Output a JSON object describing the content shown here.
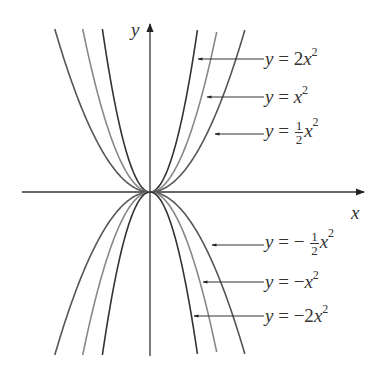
{
  "chart_data": {
    "type": "line",
    "title": "",
    "xlabel": "x",
    "ylabel": "y",
    "grid": false,
    "series": [
      {
        "name": "y = 2x^2",
        "coef": 2,
        "color": "#333333"
      },
      {
        "name": "y = x^2",
        "coef": 1,
        "color": "#888888"
      },
      {
        "name": "y = 1/2 x^2",
        "coef": 0.5,
        "color": "#555555"
      },
      {
        "name": "y = -1/2 x^2",
        "coef": -0.5,
        "color": "#555555"
      },
      {
        "name": "y = -x^2",
        "coef": -1,
        "color": "#888888"
      },
      {
        "name": "y = -2x^2",
        "coef": -2,
        "color": "#333333"
      }
    ],
    "annotations": [
      {
        "text": "y = 2x^2",
        "points_to": "y = 2x^2"
      },
      {
        "text": "y = x^2",
        "points_to": "y = x^2"
      },
      {
        "text": "y = 1/2 x^2",
        "points_to": "y = 1/2 x^2"
      },
      {
        "text": "y = -1/2 x^2",
        "points_to": "y = -1/2 x^2"
      },
      {
        "text": "y = -x^2",
        "points_to": "y = -x^2"
      },
      {
        "text": "y = -2x^2",
        "points_to": "y = -2x^2"
      }
    ]
  },
  "axes": {
    "x_label": "x",
    "y_label": "y"
  },
  "labels": {
    "l1": {
      "lhs": "y",
      "eq": " = ",
      "coef": "2",
      "var": "x",
      "exp": "2"
    },
    "l2": {
      "lhs": "y",
      "eq": " = ",
      "var": "x",
      "exp": "2"
    },
    "l3": {
      "lhs": "y",
      "eq": " = ",
      "num": "1",
      "den": "2",
      "var": "x",
      "exp": "2"
    },
    "l4": {
      "lhs": "y",
      "eq": " = − ",
      "num": "1",
      "den": "2",
      "var": "x",
      "exp": "2"
    },
    "l5": {
      "lhs": "y",
      "eq": " = −",
      "var": "x",
      "exp": "2"
    },
    "l6": {
      "lhs": "y",
      "eq": " = −2",
      "var": "x",
      "exp": "2"
    }
  }
}
